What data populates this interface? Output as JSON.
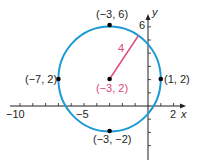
{
  "diagram": {
    "type": "circle-on-coordinate-plane",
    "center": {
      "x": -3,
      "y": 2,
      "label": "(−3, 2)"
    },
    "radius": {
      "value": 4,
      "label": "4"
    },
    "points": [
      {
        "x": -3,
        "y": 6,
        "label": "(−3, 6)"
      },
      {
        "x": -7,
        "y": 2,
        "label": "(−7, 2)"
      },
      {
        "x": 1,
        "y": 2,
        "label": "(1, 2)"
      },
      {
        "x": -3,
        "y": -2,
        "label": "(−3, −2)"
      }
    ],
    "axes": {
      "x_label": "x",
      "y_label": "y",
      "x_ticks": [
        "−10",
        "−5",
        "2"
      ],
      "y_ticks": [
        "6"
      ]
    },
    "colors": {
      "circle": "#1b9ad6",
      "radius": "#e0457b",
      "axis": "#231f20",
      "point": "#000000"
    }
  }
}
